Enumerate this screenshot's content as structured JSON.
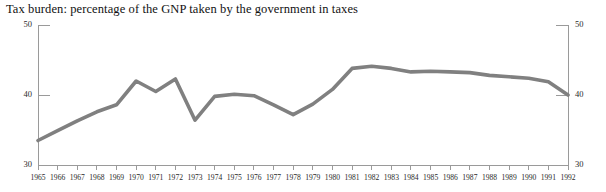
{
  "chart_data": {
    "type": "line",
    "title": "Tax burden: percentage of the GNP taken by the government in taxes",
    "xlabel": "",
    "ylabel": "",
    "ylim": [
      30,
      50
    ],
    "yticks": [
      30,
      40,
      50
    ],
    "xlim": [
      1965,
      1992
    ],
    "grid": false,
    "legend": null,
    "legend_position": "none",
    "line_color": "#808080",
    "axis_color": "#9a9a9a",
    "categories": [
      "1965",
      "1966",
      "1967",
      "1968",
      "1969",
      "1970",
      "1971",
      "1972",
      "1973",
      "1974",
      "1975",
      "1976",
      "1977",
      "1978",
      "1979",
      "1980",
      "1981",
      "1982",
      "1983",
      "1984",
      "1985",
      "1986",
      "1987",
      "1988",
      "1989",
      "1990",
      "1991",
      "1992"
    ],
    "x": [
      1965,
      1966,
      1967,
      1968,
      1969,
      1970,
      1971,
      1972,
      1973,
      1974,
      1975,
      1976,
      1977,
      1978,
      1979,
      1980,
      1981,
      1982,
      1983,
      1984,
      1985,
      1986,
      1987,
      1988,
      1989,
      1990,
      1991,
      1992
    ],
    "values": [
      33.5,
      34.9,
      36.3,
      37.6,
      38.6,
      42.0,
      40.5,
      42.3,
      36.4,
      39.8,
      40.1,
      39.9,
      38.6,
      37.2,
      38.7,
      40.8,
      43.8,
      44.1,
      43.8,
      43.3,
      43.4,
      43.3,
      43.2,
      42.8,
      42.6,
      42.4,
      41.9,
      40.0
    ],
    "series": [
      {
        "name": "Tax burden",
        "color": "#808080",
        "values": [
          33.5,
          34.9,
          36.3,
          37.6,
          38.6,
          42.0,
          40.5,
          42.3,
          36.4,
          39.8,
          40.1,
          39.9,
          38.6,
          37.2,
          38.7,
          40.8,
          43.8,
          44.1,
          43.8,
          43.3,
          43.4,
          43.3,
          43.2,
          42.8,
          42.6,
          42.4,
          41.9,
          40.0
        ]
      }
    ],
    "axes": {
      "left_ticks": [
        "50",
        "40",
        "30"
      ],
      "right_ticks": [
        "50",
        "40",
        "30"
      ]
    }
  }
}
